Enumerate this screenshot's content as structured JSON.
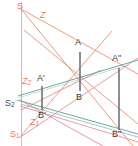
{
  "figure": {
    "width": 138,
    "height": 146,
    "background": "#ffffff",
    "colors": {
      "ray_orange": "#e8785a",
      "ray_pink": "#e07c85",
      "line_teal": "#5f9e93",
      "segment_gray": "#6e7278",
      "axis_gray": "#b8bcc0",
      "label_dark": "#3a3a3a"
    }
  },
  "labels": {
    "s_top": "S",
    "z_top": "Z",
    "a": "A",
    "a_prime": "A'",
    "a_double_prime": "A\"",
    "b": "B",
    "b_prime": "B'",
    "b_double_prime": "B\"",
    "z_two_base": "Z",
    "z_two_sub": "2",
    "z_one_base": "Z",
    "z_one_sub": "1",
    "s_two_base": "S",
    "s_two_sub": "2",
    "s_one_base": "S",
    "s_one_sub": "1"
  },
  "points": {
    "S": {
      "x": 21,
      "y": 9
    },
    "S2": {
      "x": 22,
      "y": 104
    },
    "S1": {
      "x": 25,
      "y": 133
    },
    "A": {
      "x": 80,
      "y": 47
    },
    "B": {
      "x": 80,
      "y": 92
    },
    "Aprime": {
      "x": 42,
      "y": 83
    },
    "Bprime": {
      "x": 42,
      "y": 110
    },
    "Adprime": {
      "x": 119,
      "y": 64
    },
    "Bdprime": {
      "x": 119,
      "y": 131
    }
  },
  "segments": [
    {
      "name": "vertical-axis-left",
      "color": "axis_gray",
      "from": [
        21,
        2
      ],
      "to": [
        21,
        146
      ]
    },
    {
      "name": "segment-A-B",
      "color": "segment_gray",
      "from": [
        80,
        50
      ],
      "to": [
        80,
        92
      ]
    },
    {
      "name": "segment-Aprime-Bprime",
      "color": "segment_gray",
      "from": [
        42,
        84
      ],
      "to": [
        42,
        110
      ]
    },
    {
      "name": "segment-Adprime-Bdprime",
      "color": "segment_gray",
      "from": [
        119,
        66
      ],
      "to": [
        119,
        131
      ]
    }
  ],
  "rays": [
    {
      "name": "ray-S-to-Bdprime",
      "color": "ray_orange"
    },
    {
      "name": "ray-S-to-Adprime",
      "color": "ray_orange"
    },
    {
      "name": "ray-S1-to-A-extended",
      "color": "ray_orange"
    },
    {
      "name": "ray-S1-to-Adprime",
      "color": "ray_pink"
    },
    {
      "name": "ray-S2-to-B-extended",
      "color": "ray_pink"
    },
    {
      "name": "ray-S2-to-Bdprime",
      "color": "ray_pink"
    },
    {
      "name": "line-Aprime-Adprime",
      "color": "line_teal"
    },
    {
      "name": "line-S2-Bdprime",
      "color": "line_teal"
    },
    {
      "name": "line-Bprime-horizon",
      "color": "line_teal"
    }
  ]
}
